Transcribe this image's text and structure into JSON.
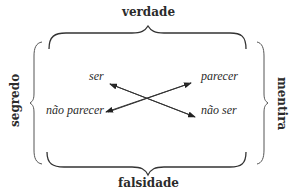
{
  "diagram": {
    "type": "semiotic-square-veridiction",
    "labels": {
      "top": "verdade",
      "bottom": "falsidade",
      "left": "segredo",
      "right": "mentira"
    },
    "terms": {
      "top_left": "ser",
      "top_right": "parecer",
      "bottom_left": "não parecer",
      "bottom_right": "não ser"
    },
    "relations": [
      {
        "from": "não ser",
        "to": "ser",
        "type": "contradiction-arrow"
      },
      {
        "from": "não parecer",
        "to": "parecer",
        "type": "contradiction-arrow"
      }
    ],
    "colors": {
      "ink": "#2b2b2b",
      "brace": "#333333",
      "background": "#ffffff"
    }
  }
}
